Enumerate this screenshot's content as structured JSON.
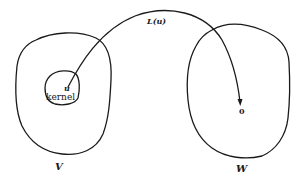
{
  "diagram": {
    "type": "linear-map-kernel",
    "colors": {
      "stroke": "#1a1a1a",
      "background": "#ffffff"
    },
    "sets": [
      {
        "id": "V",
        "label": "V",
        "role": "domain"
      },
      {
        "id": "W",
        "label": "W",
        "role": "codomain"
      }
    ],
    "subsets": [
      {
        "id": "kernel",
        "label": "kernel",
        "parent": "V"
      }
    ],
    "points": [
      {
        "id": "u",
        "label": "u",
        "in": "kernel"
      },
      {
        "id": "zero",
        "label": "0",
        "in": "W"
      }
    ],
    "arrows": [
      {
        "from": "u",
        "to": "zero",
        "label": "L(u)"
      }
    ]
  }
}
